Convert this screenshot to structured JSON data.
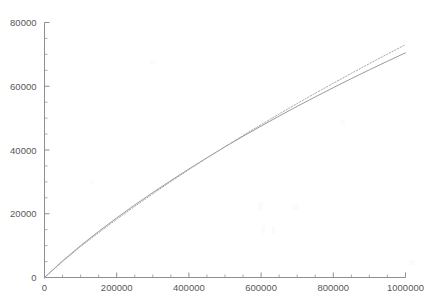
{
  "chart_data": {
    "type": "line",
    "title": "",
    "subtitle": "",
    "xlabel": "",
    "ylabel": "",
    "xlim": [
      0,
      1000000
    ],
    "ylim": [
      0,
      80000
    ],
    "grid": false,
    "legend": "none",
    "x_ticks": [
      {
        "value": 0,
        "label": "0"
      },
      {
        "value": 200000,
        "label": "200000"
      },
      {
        "value": 400000,
        "label": "400000"
      },
      {
        "value": 600000,
        "label": "600000"
      },
      {
        "value": 800000,
        "label": "800000"
      },
      {
        "value": 1000000,
        "label": "1000000"
      }
    ],
    "y_ticks": [
      {
        "value": 0,
        "label": "0"
      },
      {
        "value": 20000,
        "label": "20000"
      },
      {
        "value": 40000,
        "label": "40000"
      },
      {
        "value": 60000,
        "label": "60000"
      },
      {
        "value": 80000,
        "label": "80000"
      }
    ],
    "x_minor_tick_step": 50000,
    "y_minor_tick_step": 5000,
    "series": [
      {
        "name": "solid-curve",
        "style": "solid",
        "color": "#9a9a9a",
        "x": [
          0,
          50000,
          100000,
          150000,
          200000,
          250000,
          300000,
          350000,
          400000,
          450000,
          500000,
          550000,
          600000,
          650000,
          700000,
          750000,
          800000,
          850000,
          900000,
          950000,
          1000000
        ],
        "values": [
          0,
          5200,
          10000,
          14450,
          18700,
          22750,
          26650,
          30400,
          34050,
          37550,
          41000,
          44300,
          47500,
          50650,
          53700,
          56650,
          59550,
          62400,
          65150,
          67850,
          70500
        ]
      },
      {
        "name": "dotted-curve",
        "style": "dotted",
        "color": "#a8a8a8",
        "x": [
          0,
          50000,
          100000,
          150000,
          200000,
          250000,
          300000,
          350000,
          400000,
          450000,
          500000,
          550000,
          600000,
          650000,
          700000,
          750000,
          800000,
          850000,
          900000,
          950000,
          1000000
        ],
        "values": [
          0,
          5000,
          9700,
          14050,
          18250,
          22300,
          26250,
          30100,
          33850,
          37500,
          41050,
          44550,
          47950,
          51300,
          54600,
          57800,
          60950,
          64050,
          67100,
          70100,
          73050
        ]
      }
    ],
    "axis_color": "#8f8f8f"
  }
}
